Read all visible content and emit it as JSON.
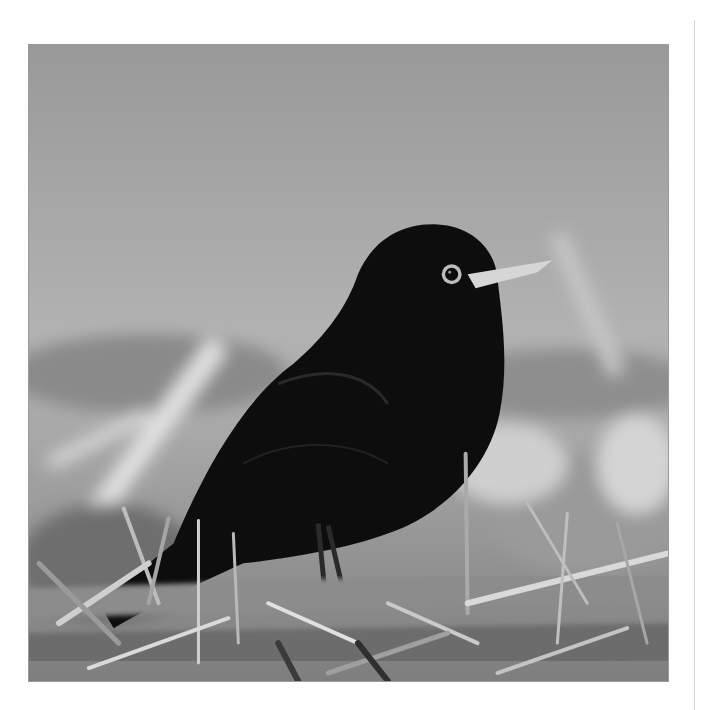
{
  "photo": {
    "subject": "blackbird",
    "description": "Black-and-white photograph of a blackbird standing on grass",
    "colors": {
      "sky_top": "#9c9c9c",
      "sky_mid": "#b4b4b4",
      "bird": "#0c0c0c",
      "beak": "#d8d8d8",
      "grass_light": "#d9d9d9",
      "grass_dark": "#3a3a3a",
      "page_bg": "#fefefe"
    }
  }
}
